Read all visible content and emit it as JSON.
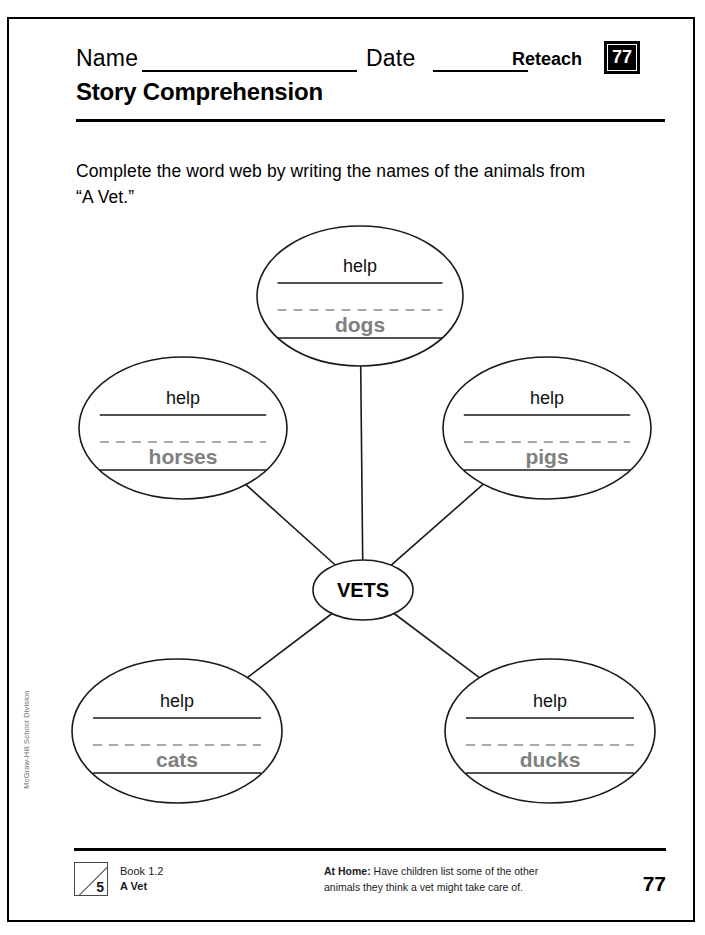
{
  "header": {
    "name_label": "Name",
    "date_label": "Date",
    "reteach_label": "Reteach",
    "reteach_number": "77",
    "title": "Story Comprehension"
  },
  "instruction": "Complete the word web by writing the names of the animals from “A Vet.”",
  "web": {
    "center_label": "VETS",
    "node_prompt": "help",
    "nodes": [
      {
        "id": "top",
        "answer": "dogs",
        "cx": 300,
        "cy": 83,
        "rx": 103,
        "ry": 70
      },
      {
        "id": "middle-left",
        "answer": "horses",
        "cx": 123,
        "cy": 215,
        "rx": 104,
        "ry": 71
      },
      {
        "id": "middle-right",
        "answer": "pigs",
        "cx": 487,
        "cy": 215,
        "rx": 104,
        "ry": 71
      },
      {
        "id": "bottom-left",
        "answer": "cats",
        "cx": 117,
        "cy": 518,
        "rx": 105,
        "ry": 72
      },
      {
        "id": "bottom-right",
        "answer": "ducks",
        "cx": 490,
        "cy": 518,
        "rx": 105,
        "ry": 72
      }
    ],
    "center": {
      "cx": 303,
      "cy": 377,
      "rx": 50,
      "ry": 30
    }
  },
  "side_imprint": "McGraw-Hill School Division",
  "footer": {
    "book_mark_number": "5",
    "book_line1": "Book 1.2",
    "book_line2": "A Vet",
    "at_home_label": "At Home:",
    "at_home_text": " Have children list some of the other animals they think a vet might take care of.",
    "page_number": "77"
  },
  "colors": {
    "ink": "#000000",
    "answer_gray": "#808080",
    "dash_gray": "#8c8c8c",
    "imprint_gray": "#6e6e6e"
  }
}
